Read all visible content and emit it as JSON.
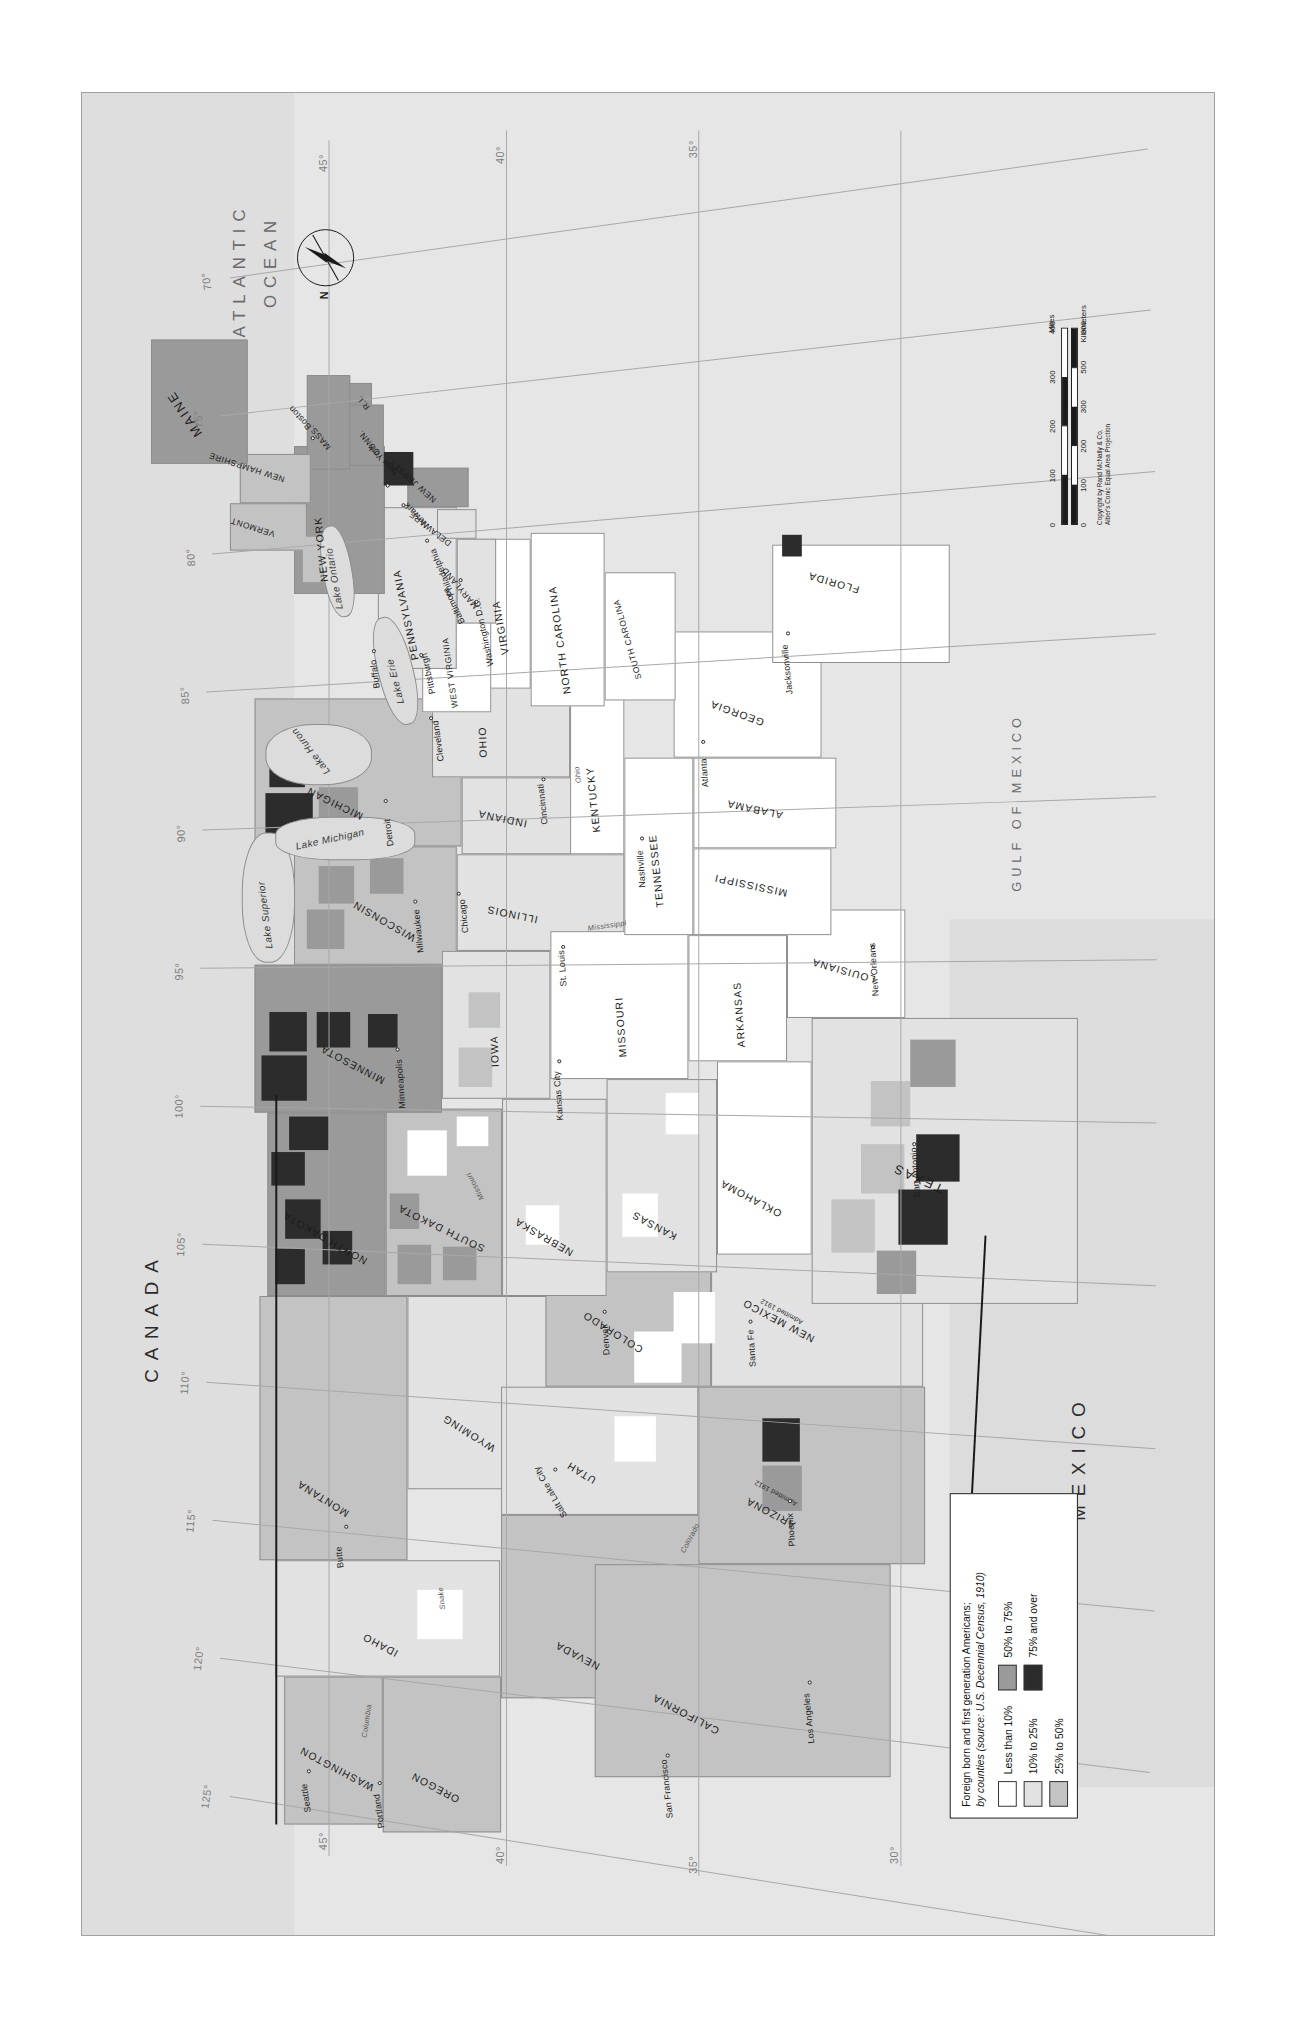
{
  "map": {
    "title_line1": "Foreign born and first generation Americans;",
    "title_line2": "by counties (source: U.S. Decennial Census, 1910)",
    "title_plain": "Foreign born and first generation Americans; by counties",
    "source": "source: U.S. Decennial Census, 1910",
    "projection_note": "Alber's Conic Equal Area Projection",
    "copyright": "Copyright by Rand McNally & Co.",
    "orientation": "rotated-90-ccw"
  },
  "legend": {
    "title_line1": "Foreign born and first generation Americans;",
    "title_line2": "by counties (source: U.S. Decennial Census, 1910)",
    "source_italic": "source: U.S. Decennial Census, 1910",
    "classes": [
      {
        "label": "Less than 10%",
        "color": "#ffffff"
      },
      {
        "label": "10% to 25%",
        "color": "#e2e2e2"
      },
      {
        "label": "25% to 50%",
        "color": "#c3c3c3"
      },
      {
        "label": "50% to 75%",
        "color": "#9a9a9a"
      },
      {
        "label": "75% and over",
        "color": "#2c2c2c"
      }
    ]
  },
  "scale": {
    "miles_unit": "Miles",
    "kilometers_unit": "Kilometers",
    "miles_ticks": [
      "0",
      "100",
      "200",
      "300",
      "400"
    ],
    "km_ticks": [
      "0",
      "100",
      "200",
      "300",
      "500",
      "800"
    ],
    "km_ticks_shown": [
      "0",
      "100",
      "200",
      "300",
      "500",
      "800"
    ]
  },
  "compass": {
    "north_label": "N"
  },
  "countries": [
    {
      "name": "CANADA"
    },
    {
      "name": "MEXICO"
    }
  ],
  "oceans": [
    {
      "name": "ATLANTIC\nOCEAN",
      "line1": "ATLANTIC",
      "line2": "OCEAN"
    },
    {
      "name": "PACIFIC\nOCEAN",
      "line1": "PACIFIC",
      "line2": "OCEAN"
    },
    {
      "name": "GULF OF MEXICO",
      "line1": "GULF OF MEXICO",
      "line2": ""
    }
  ],
  "lakes": [
    {
      "name": "Lake Superior"
    },
    {
      "name": "Lake Michigan"
    },
    {
      "name": "Lake Huron"
    },
    {
      "name": "Lake Erie"
    },
    {
      "name": "Lake Ontario"
    }
  ],
  "rivers": [
    {
      "name": "Columbia"
    },
    {
      "name": "Snake"
    },
    {
      "name": "Colorado"
    },
    {
      "name": "Missouri"
    },
    {
      "name": "Mississippi"
    },
    {
      "name": "Ohio"
    }
  ],
  "states": [
    {
      "name": "MAINE"
    },
    {
      "name": "VERMONT"
    },
    {
      "name": "NEW HAMPSHIRE"
    },
    {
      "name": "MASS."
    },
    {
      "name": "CONN."
    },
    {
      "name": "R.I."
    },
    {
      "name": "NEW YORK"
    },
    {
      "name": "NEW JERSEY"
    },
    {
      "name": "PENNSYLVANIA"
    },
    {
      "name": "DELAWARE"
    },
    {
      "name": "MARYLAND"
    },
    {
      "name": "WEST VIRGINIA"
    },
    {
      "name": "VIRGINIA"
    },
    {
      "name": "NORTH CAROLINA"
    },
    {
      "name": "SOUTH CAROLINA"
    },
    {
      "name": "GEORGIA"
    },
    {
      "name": "FLORIDA"
    },
    {
      "name": "OHIO"
    },
    {
      "name": "INDIANA"
    },
    {
      "name": "KENTUCKY"
    },
    {
      "name": "TENNESSEE"
    },
    {
      "name": "ALABAMA"
    },
    {
      "name": "MISSISSIPPI"
    },
    {
      "name": "MICHIGAN"
    },
    {
      "name": "ILLINOIS"
    },
    {
      "name": "WISCONSIN"
    },
    {
      "name": "MINNESOTA"
    },
    {
      "name": "IOWA"
    },
    {
      "name": "MISSOURI"
    },
    {
      "name": "ARKANSAS"
    },
    {
      "name": "LOUISIANA"
    },
    {
      "name": "NORTH DAKOTA"
    },
    {
      "name": "SOUTH DAKOTA"
    },
    {
      "name": "NEBRASKA"
    },
    {
      "name": "KANSAS"
    },
    {
      "name": "OKLAHOMA"
    },
    {
      "name": "TEXAS"
    },
    {
      "name": "MONTANA"
    },
    {
      "name": "WYOMING"
    },
    {
      "name": "COLORADO"
    },
    {
      "name": "NEW MEXICO",
      "note": "Admitted 1912"
    },
    {
      "name": "ARIZONA",
      "note": "Admitted 1912"
    },
    {
      "name": "UTAH"
    },
    {
      "name": "IDAHO"
    },
    {
      "name": "NEVADA"
    },
    {
      "name": "WASHINGTON"
    },
    {
      "name": "OREGON"
    },
    {
      "name": "CALIFORNIA"
    }
  ],
  "cities": [
    {
      "name": "Boston"
    },
    {
      "name": "New York"
    },
    {
      "name": "Newark"
    },
    {
      "name": "Philadelphia"
    },
    {
      "name": "Baltimore"
    },
    {
      "name": "Washington D.C."
    },
    {
      "name": "Pittsburgh"
    },
    {
      "name": "Buffalo"
    },
    {
      "name": "Cleveland"
    },
    {
      "name": "Cincinnati"
    },
    {
      "name": "Detroit"
    },
    {
      "name": "Chicago"
    },
    {
      "name": "Milwaukee"
    },
    {
      "name": "Minneapolis"
    },
    {
      "name": "St. Louis"
    },
    {
      "name": "Kansas City"
    },
    {
      "name": "Nashville"
    },
    {
      "name": "Atlanta"
    },
    {
      "name": "Jacksonville"
    },
    {
      "name": "New Orleans"
    },
    {
      "name": "San Antonio"
    },
    {
      "name": "Santa Fe"
    },
    {
      "name": "Phoenix"
    },
    {
      "name": "Denver"
    },
    {
      "name": "Salt Lake City"
    },
    {
      "name": "Butte"
    },
    {
      "name": "Seattle"
    },
    {
      "name": "Portland"
    },
    {
      "name": "San Francisco"
    },
    {
      "name": "Los Angeles"
    }
  ],
  "graticule": {
    "longitudes": [
      "125°",
      "120°",
      "115°",
      "110°",
      "105°",
      "100°",
      "95°",
      "90°",
      "85°",
      "80°",
      "75°",
      "70°"
    ],
    "latitudes": [
      "30°",
      "35°",
      "40°",
      "45°"
    ],
    "top_ticks": [
      "45°",
      "40°",
      "35°",
      "30°"
    ],
    "right_ticks": [
      "75°",
      "80°",
      "85°",
      "90°",
      "95°",
      "100°",
      "105°",
      "110°"
    ]
  },
  "state_notes": [
    {
      "state": "NEW MEXICO",
      "text": "Admitted 1912"
    },
    {
      "state": "ARIZONA",
      "text": "Admitted 1912"
    }
  ]
}
